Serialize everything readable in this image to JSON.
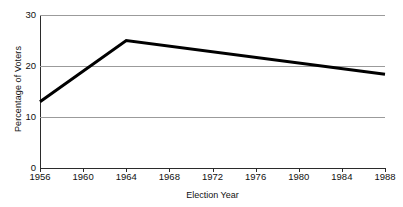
{
  "chart_data": {
    "type": "line",
    "title": "",
    "xlabel": "Election Year",
    "ylabel": "Percentage of Voters",
    "x": [
      1956,
      1960,
      1964,
      1968,
      1972,
      1976,
      1980,
      1984,
      1988
    ],
    "xtick_labels": [
      "1956",
      "1960",
      "1964",
      "1968",
      "1972",
      "1976",
      "1980",
      "1984",
      "1988"
    ],
    "ytick_labels": [
      "0",
      "10",
      "20",
      "30"
    ],
    "yticks": [
      0,
      10,
      20,
      30
    ],
    "ylim": [
      0,
      30
    ],
    "xlim": [
      1956,
      1988
    ],
    "grid": "horizontal",
    "legend": "none",
    "series": [
      {
        "name": "Percentage of Voters",
        "color": "#000000",
        "line_width": 3,
        "points": [
          {
            "x": 1956,
            "y": 13.0
          },
          {
            "x": 1964,
            "y": 25.0
          },
          {
            "x": 1988,
            "y": 18.4
          }
        ],
        "values": [
          13.0,
          19.0,
          25.0,
          23.9,
          22.8,
          21.7,
          20.6,
          19.5,
          18.4
        ]
      }
    ]
  }
}
